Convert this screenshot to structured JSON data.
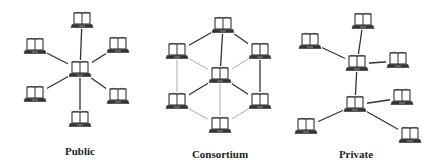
{
  "colors": {
    "background": "#ffffff",
    "strong_edge": "#333333",
    "weak_edge": "#9a9a9a",
    "icon_stroke": "#333333"
  },
  "networks": [
    {
      "id": "public",
      "label": "Public",
      "label_pos": [
        80,
        145
      ],
      "nodes": [
        {
          "id": "c",
          "x": 80,
          "y": 70
        },
        {
          "id": "t",
          "x": 82,
          "y": 21
        },
        {
          "id": "tl",
          "x": 35,
          "y": 47
        },
        {
          "id": "tr",
          "x": 118,
          "y": 46
        },
        {
          "id": "bl",
          "x": 35,
          "y": 95
        },
        {
          "id": "br",
          "x": 118,
          "y": 97
        },
        {
          "id": "b",
          "x": 80,
          "y": 120
        }
      ],
      "edges": [
        {
          "from": "c",
          "to": "t",
          "style": "strong"
        },
        {
          "from": "c",
          "to": "tl",
          "style": "strong"
        },
        {
          "from": "c",
          "to": "tr",
          "style": "strong"
        },
        {
          "from": "c",
          "to": "bl",
          "style": "strong"
        },
        {
          "from": "c",
          "to": "br",
          "style": "strong"
        },
        {
          "from": "c",
          "to": "b",
          "style": "strong"
        }
      ]
    },
    {
      "id": "consortium",
      "label": "Consortium",
      "label_pos": [
        220,
        148
      ],
      "nodes": [
        {
          "id": "t",
          "x": 223,
          "y": 26
        },
        {
          "id": "ul",
          "x": 177,
          "y": 52
        },
        {
          "id": "ur",
          "x": 260,
          "y": 52
        },
        {
          "id": "c",
          "x": 220,
          "y": 76
        },
        {
          "id": "ll",
          "x": 177,
          "y": 102
        },
        {
          "id": "lr",
          "x": 260,
          "y": 102
        },
        {
          "id": "b",
          "x": 220,
          "y": 126
        }
      ],
      "edges": [
        {
          "from": "t",
          "to": "ul",
          "style": "strong"
        },
        {
          "from": "t",
          "to": "ur",
          "style": "strong"
        },
        {
          "from": "t",
          "to": "c",
          "style": "strong"
        },
        {
          "from": "ul",
          "to": "c",
          "style": "weak"
        },
        {
          "from": "ur",
          "to": "c",
          "style": "weak"
        },
        {
          "from": "ul",
          "to": "ll",
          "style": "weak"
        },
        {
          "from": "ur",
          "to": "lr",
          "style": "strong"
        },
        {
          "from": "c",
          "to": "ll",
          "style": "strong"
        },
        {
          "from": "c",
          "to": "lr",
          "style": "strong"
        },
        {
          "from": "c",
          "to": "b",
          "style": "weak"
        },
        {
          "from": "ll",
          "to": "b",
          "style": "weak"
        },
        {
          "from": "lr",
          "to": "b",
          "style": "weak"
        }
      ]
    },
    {
      "id": "private",
      "label": "Private",
      "label_pos": [
        356,
        148
      ],
      "nodes": [
        {
          "id": "t",
          "x": 363,
          "y": 22
        },
        {
          "id": "l",
          "x": 310,
          "y": 42
        },
        {
          "id": "h1",
          "x": 357,
          "y": 64
        },
        {
          "id": "r",
          "x": 398,
          "y": 61
        },
        {
          "id": "h2",
          "x": 355,
          "y": 105
        },
        {
          "id": "r2",
          "x": 402,
          "y": 98
        },
        {
          "id": "bl",
          "x": 306,
          "y": 127
        },
        {
          "id": "br",
          "x": 410,
          "y": 136
        }
      ],
      "edges": [
        {
          "from": "h1",
          "to": "t",
          "style": "strong"
        },
        {
          "from": "h1",
          "to": "l",
          "style": "strong"
        },
        {
          "from": "h1",
          "to": "r",
          "style": "strong"
        },
        {
          "from": "h1",
          "to": "h2",
          "style": "strong"
        },
        {
          "from": "h2",
          "to": "r2",
          "style": "strong"
        },
        {
          "from": "h2",
          "to": "bl",
          "style": "strong"
        },
        {
          "from": "h2",
          "to": "br",
          "style": "strong"
        }
      ]
    }
  ],
  "icon": {
    "name": "laptop-icon",
    "width": 20,
    "height": 16
  }
}
